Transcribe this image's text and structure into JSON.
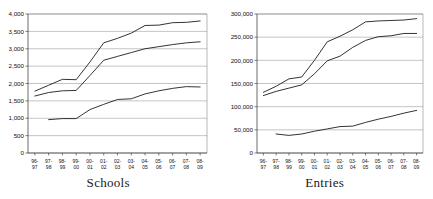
{
  "figure": {
    "background_color": "#ffffff",
    "line_color": "#1d1d1d",
    "grid_color": "#8a8a8a"
  },
  "panels": [
    {
      "name": "schools",
      "title": "Schools"
    },
    {
      "name": "entries",
      "title": "Entries"
    }
  ],
  "chart_data": [
    {
      "type": "line",
      "title": "Schools",
      "xlabel": "",
      "ylabel": "",
      "ylim": [
        0,
        4000
      ],
      "ytick_interval": 500,
      "grid": true,
      "legend": "none",
      "categories": [
        "96-97",
        "97-98",
        "98-99",
        "99-00",
        "00-01",
        "01-02",
        "02-03",
        "03-04",
        "04-05",
        "05-06",
        "06-07",
        "07-08",
        "08-09"
      ],
      "ytick_labels": [
        "0",
        "500",
        "1,000",
        "1,500",
        "2,000",
        "2,500",
        "3,000",
        "3,500",
        "4,000"
      ],
      "ytick_values": [
        0,
        500,
        1000,
        1500,
        2000,
        2500,
        3000,
        3500,
        4000
      ],
      "series": [
        {
          "name": "upper",
          "values": [
            1780,
            1950,
            2120,
            2110,
            2620,
            3170,
            3300,
            3450,
            3670,
            3680,
            3750,
            3760,
            3800
          ]
        },
        {
          "name": "middle",
          "values": [
            1640,
            1740,
            1790,
            1800,
            2230,
            2670,
            2780,
            2890,
            3000,
            3060,
            3120,
            3170,
            3200
          ]
        },
        {
          "name": "lower",
          "values": [
            null,
            960,
            990,
            990,
            1250,
            1400,
            1540,
            1560,
            1700,
            1790,
            1860,
            1910,
            1900
          ]
        }
      ]
    },
    {
      "type": "line",
      "title": "Entries",
      "xlabel": "",
      "ylabel": "",
      "ylim": [
        0,
        300000
      ],
      "ytick_interval": 50000,
      "grid": true,
      "legend": "none",
      "categories": [
        "96-97",
        "97-98",
        "98-99",
        "99-00",
        "00-01",
        "01-02",
        "02-03",
        "03-04",
        "04-05",
        "05-06",
        "06-07",
        "07-08",
        "08-09"
      ],
      "ytick_labels": [
        "0",
        "50,000",
        "100,000",
        "150,000",
        "200,000",
        "250,000",
        "300,000"
      ],
      "ytick_values": [
        0,
        50000,
        100000,
        150000,
        200000,
        250000,
        300000
      ],
      "series": [
        {
          "name": "upper",
          "values": [
            131000,
            144000,
            160000,
            164000,
            200000,
            240000,
            252000,
            266000,
            283000,
            285000,
            286000,
            287000,
            290000
          ]
        },
        {
          "name": "middle",
          "values": [
            124000,
            133000,
            140000,
            147000,
            171000,
            199000,
            209000,
            228000,
            243000,
            251000,
            253000,
            258000,
            258000
          ]
        },
        {
          "name": "lower",
          "values": [
            null,
            41000,
            38000,
            41000,
            47000,
            52000,
            57000,
            58000,
            66000,
            73000,
            79000,
            86000,
            92000
          ]
        }
      ]
    }
  ]
}
